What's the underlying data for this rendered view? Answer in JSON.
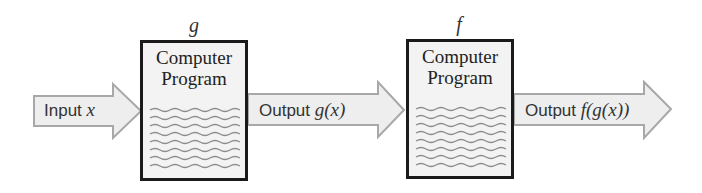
{
  "diagram": {
    "type": "function-composition-flow",
    "input_arrow": {
      "label_text": "Input ",
      "label_math": "x"
    },
    "programs": [
      {
        "func_name": "g",
        "title_line1": "Computer",
        "title_line2": "Program",
        "wavy_lines": 8
      },
      {
        "func_name": "f",
        "title_line1": "Computer",
        "title_line2": "Program",
        "wavy_lines": 8
      }
    ],
    "middle_arrow": {
      "label_text": "Output ",
      "label_math": "g(x)"
    },
    "output_arrow": {
      "label_text": "Output ",
      "label_math": "f(g(x))"
    },
    "colors": {
      "arrow_fill": "#eeeeee",
      "arrow_stroke": "#a8a8a8",
      "box_fill": "#f3f3f3",
      "box_border": "#1a1a1a",
      "wave_color": "#8c8c8c"
    }
  }
}
